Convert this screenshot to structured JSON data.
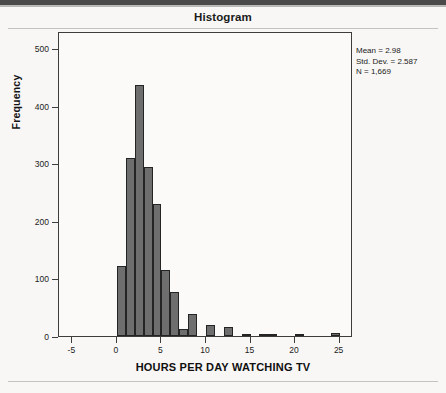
{
  "chart_data": {
    "type": "bar",
    "title": "Histogram",
    "xlabel": "HOURS PER DAY WATCHING TV",
    "ylabel": "Frequency",
    "xlim": [
      -6.5,
      26.5
    ],
    "ylim": [
      0,
      530
    ],
    "xticks": [
      -5,
      0,
      5,
      10,
      15,
      20,
      25
    ],
    "xtick_labels": [
      "-5",
      "0",
      "5",
      "10",
      "15",
      "20",
      "25"
    ],
    "yticks": [
      0,
      100,
      200,
      300,
      400,
      500
    ],
    "ytick_labels": [
      "0",
      "100",
      "200",
      "300",
      "400",
      "500"
    ],
    "grid": false,
    "legend": null,
    "bin_width": 1,
    "bars": [
      {
        "x0": 0,
        "x1": 1,
        "value": 121
      },
      {
        "x0": 1,
        "x1": 2,
        "value": 310
      },
      {
        "x0": 2,
        "x1": 3,
        "value": 437
      },
      {
        "x0": 3,
        "x1": 4,
        "value": 294
      },
      {
        "x0": 4,
        "x1": 5,
        "value": 229
      },
      {
        "x0": 5,
        "x1": 6,
        "value": 114
      },
      {
        "x0": 6,
        "x1": 7,
        "value": 77
      },
      {
        "x0": 7,
        "x1": 8,
        "value": 13
      },
      {
        "x0": 8,
        "x1": 9,
        "value": 38
      },
      {
        "x0": 10,
        "x1": 11,
        "value": 19
      },
      {
        "x0": 12,
        "x1": 13,
        "value": 16
      },
      {
        "x0": 14,
        "x1": 15,
        "value": 3
      },
      {
        "x0": 16,
        "x1": 17,
        "value": 4
      },
      {
        "x0": 17,
        "x1": 18,
        "value": 2
      },
      {
        "x0": 20,
        "x1": 21,
        "value": 3
      },
      {
        "x0": 24,
        "x1": 25,
        "value": 6
      }
    ],
    "bar_color": "#6e6e6e",
    "bar_edge_color": "#242424"
  },
  "annotation": {
    "mean": "Mean = 2.98",
    "std_dev": "Std. Dev. = 2.587",
    "n": "N = 1,669"
  }
}
